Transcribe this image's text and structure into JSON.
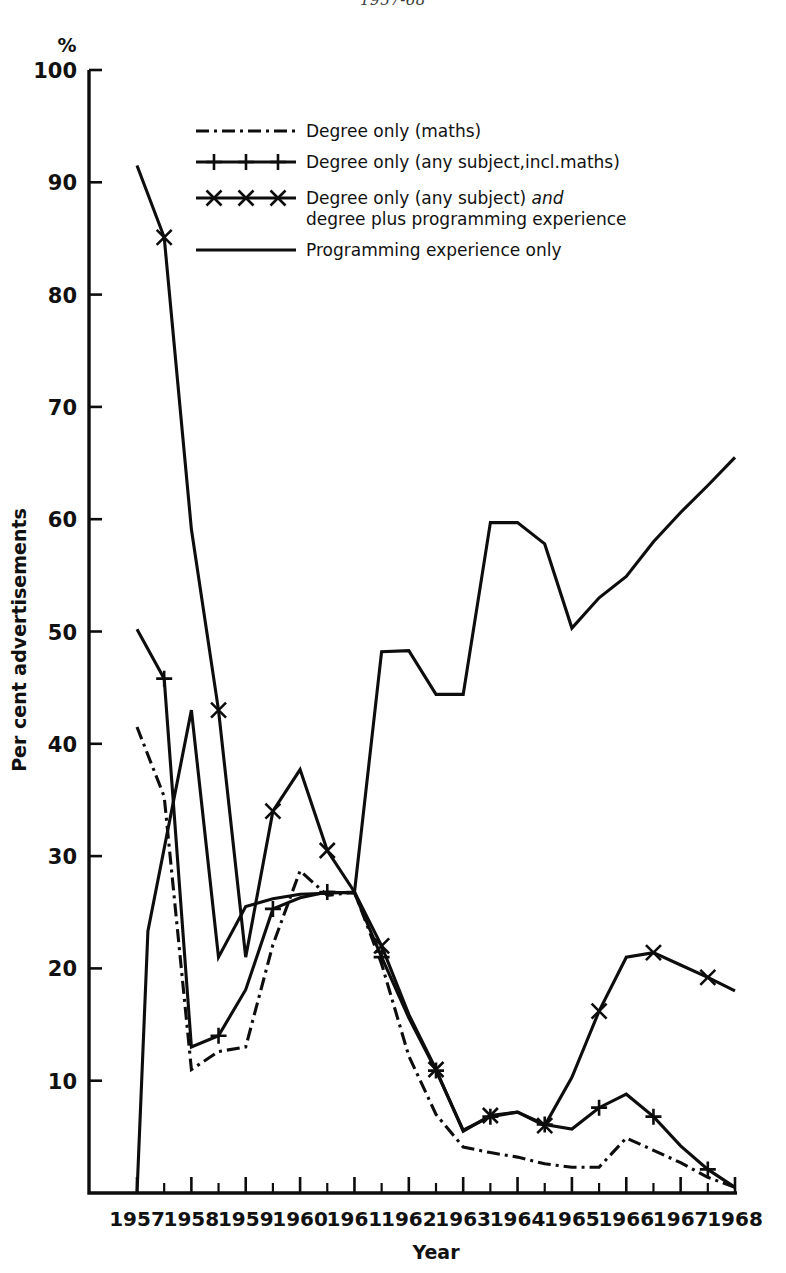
{
  "figure": {
    "cut_header": "1957-68",
    "background": "#ffffff",
    "ink_color": "#0d0d0d"
  },
  "chart_data": {
    "type": "line",
    "title": "",
    "xlabel": "Year",
    "ylabel": "Per cent advertisements",
    "y_unit_symbol": "%",
    "xlim": [
      1957,
      1968
    ],
    "ylim": [
      0,
      100
    ],
    "yticks": [
      0,
      10,
      20,
      30,
      40,
      50,
      60,
      70,
      80,
      90,
      100
    ],
    "ytick_labels": [
      "",
      "10",
      "20",
      "30",
      "40",
      "50",
      "60",
      "70",
      "80",
      "90",
      "100"
    ],
    "xticks": [
      1957,
      1958,
      1959,
      1960,
      1961,
      1962,
      1963,
      1964,
      1965,
      1966,
      1967,
      1968
    ],
    "xtick_labels": [
      "1957",
      "1958",
      "1959",
      "1960",
      "1961",
      "1962",
      "1963",
      "1964",
      "1965",
      "1966",
      "1967",
      "1968"
    ],
    "x_minor_ticks": [
      1957.5,
      1958.5,
      1959.5,
      1960.5,
      1961.5,
      1962.5,
      1963.5,
      1964.5,
      1965.5,
      1966.5,
      1967.5
    ],
    "grid": false,
    "legend_position": "upper-center",
    "series": [
      {
        "name": "Degree only (maths)",
        "style": "dash-dot",
        "marker": "none",
        "x": [
          1957,
          1957.5,
          1958,
          1958.5,
          1959,
          1959.5,
          1960,
          1960.5,
          1961,
          1961.5,
          1962,
          1962.5,
          1963,
          1963.5,
          1964,
          1964.5,
          1965,
          1965.5,
          1966,
          1966.5,
          1967,
          1967.5,
          1968
        ],
        "values": [
          41.5,
          35.3,
          11.0,
          12.6,
          13.0,
          22.1,
          28.7,
          26.5,
          26.8,
          20.4,
          12.2,
          7.0,
          4.1,
          3.6,
          3.2,
          2.6,
          2.3,
          2.3,
          4.9,
          3.8,
          2.7,
          1.4,
          0.5
        ]
      },
      {
        "name": "Degree only (any subject,incl.maths)",
        "style": "solid",
        "marker": "plus",
        "x": [
          1957,
          1957.5,
          1958,
          1958.5,
          1959,
          1959.5,
          1960,
          1960.5,
          1961,
          1961.5,
          1962,
          1962.5,
          1963,
          1963.5,
          1964,
          1964.5,
          1965,
          1965.5,
          1966,
          1966.5,
          1967,
          1967.5,
          1968
        ],
        "values": [
          50.2,
          45.8,
          13.0,
          14.0,
          18.1,
          25.3,
          26.3,
          26.8,
          26.7,
          21.0,
          15.6,
          10.9,
          5.6,
          6.8,
          7.2,
          6.1,
          5.7,
          7.6,
          8.8,
          6.8,
          4.2,
          2.1,
          0.5
        ]
      },
      {
        "name": "Degree only (any subject) and degree plus programming experience",
        "name_line1": "Degree only (any subject) and",
        "name_line2": "degree plus programming experience",
        "style": "solid",
        "marker": "x",
        "x": [
          1957,
          1957.5,
          1958,
          1958.5,
          1959,
          1959.5,
          1960,
          1960.5,
          1961,
          1961.5,
          1962,
          1962.5,
          1963,
          1963.5,
          1964,
          1964.5,
          1965,
          1965.5,
          1966,
          1966.5,
          1967,
          1967.5,
          1968
        ],
        "values": [
          91.5,
          85.1,
          59.1,
          43.0,
          21.0,
          34.0,
          37.7,
          30.5,
          26.8,
          22.0,
          15.9,
          11.0,
          5.5,
          6.9,
          7.2,
          6.0,
          10.3,
          16.2,
          21.0,
          21.4,
          20.3,
          19.2,
          18.0
        ]
      },
      {
        "name": "Programming experience only",
        "style": "solid-thick",
        "marker": "none",
        "x": [
          1957,
          1957.2,
          1958,
          1958.5,
          1959,
          1959.5,
          1960,
          1960.5,
          1961,
          1961.5,
          1962,
          1962.5,
          1963,
          1963.5,
          1964,
          1964.5,
          1965,
          1965.5,
          1966,
          1966.5,
          1967,
          1967.5,
          1968
        ],
        "values": [
          0.0,
          23.3,
          43.0,
          21.0,
          25.5,
          26.2,
          26.6,
          26.7,
          26.8,
          48.2,
          48.3,
          44.4,
          44.4,
          59.7,
          59.7,
          57.8,
          50.3,
          53.0,
          54.9,
          58.0,
          60.6,
          63.0,
          65.5
        ]
      }
    ],
    "annotations": []
  },
  "legend": {
    "entries": [
      {
        "label": "Degree only (maths)",
        "sample": "dash-dot-line"
      },
      {
        "label": "Degree only (any subject,incl.maths)",
        "sample": "plus-marker-line"
      },
      {
        "label_line1_a": "Degree only (any subject) ",
        "label_line1_b": "and",
        "label_line2": "degree plus programming experience",
        "sample": "x-marker-line"
      },
      {
        "label": "Programming experience only",
        "sample": "solid-line"
      }
    ]
  }
}
